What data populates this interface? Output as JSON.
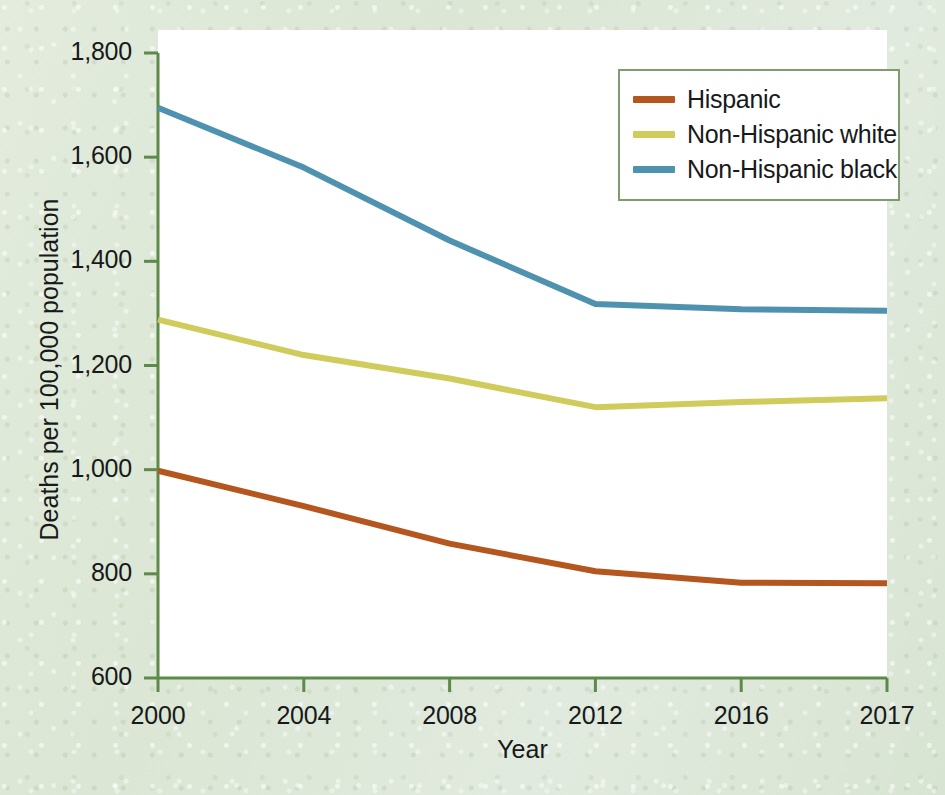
{
  "figure": {
    "background_color": "#dfe9da",
    "plot_background_color": "#ffffff",
    "axis_color": "#5d8a4a",
    "text_color": "#17191a"
  },
  "axes": {
    "y_title": "Deaths per 100,000 population",
    "x_title": "Year",
    "y_ticks": [
      "600",
      "800",
      "1,000",
      "1,200",
      "1,400",
      "1,600",
      "1,800"
    ],
    "x_ticks": [
      "2000",
      "2004",
      "2008",
      "2012",
      "2016",
      "2017"
    ]
  },
  "legend": {
    "items": [
      {
        "label": "Hispanic",
        "color": "#b4561d"
      },
      {
        "label": "Non-Hispanic white",
        "color": "#cfcc5b"
      },
      {
        "label": "Non-Hispanic black",
        "color": "#4e92b0"
      }
    ]
  },
  "chart_data": {
    "type": "line",
    "title": "",
    "xlabel": "Year",
    "ylabel": "Deaths per 100,000 population",
    "x": [
      "2000",
      "2004",
      "2008",
      "2012",
      "2016",
      "2017"
    ],
    "xlim": [
      2000,
      2017
    ],
    "ylim": [
      600,
      1800
    ],
    "ytick_values": [
      600,
      800,
      1000,
      1200,
      1400,
      1600,
      1800
    ],
    "grid": false,
    "legend_position": "top-right",
    "x_axis_spacing": "categorical",
    "series": [
      {
        "name": "Hispanic",
        "color": "#b4561d",
        "values": [
          998,
          930,
          858,
          805,
          783,
          782
        ]
      },
      {
        "name": "Non-Hispanic white",
        "color": "#cfcc5b",
        "values": [
          1288,
          1220,
          1175,
          1120,
          1130,
          1137
        ]
      },
      {
        "name": "Non-Hispanic black",
        "color": "#4e92b0",
        "values": [
          1695,
          1580,
          1440,
          1318,
          1308,
          1305
        ]
      }
    ]
  }
}
